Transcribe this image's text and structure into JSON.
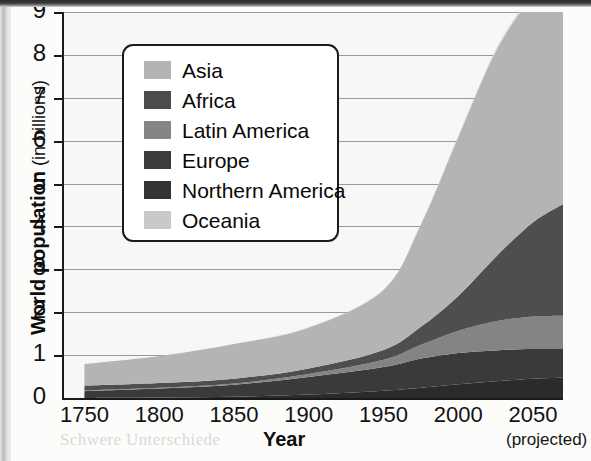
{
  "chart_data": {
    "type": "area",
    "xlabel": "Year",
    "ylabel": "World population (in billions)",
    "ylabel_main": "World population",
    "ylabel_sub": "(in billions)",
    "projected_note": "(projected)",
    "xlim": [
      1735,
      2070
    ],
    "ylim": [
      0,
      9
    ],
    "xticks": [
      1750,
      1800,
      1850,
      1900,
      1950,
      2000,
      2050
    ],
    "xtick_labels": [
      "1750",
      "1800",
      "1850",
      "1900",
      "1950",
      "2000",
      "2050"
    ],
    "yticks": [
      0,
      1,
      2,
      3,
      4,
      5,
      6,
      7,
      8,
      9
    ],
    "ytick_labels": [
      "0",
      "1",
      "2",
      "3",
      "4",
      "5",
      "6",
      "7",
      "8",
      "9"
    ],
    "grid": true,
    "legend_position": "upper-left-inset",
    "stack_order_bottom_to_top": [
      "Northern America",
      "Europe",
      "Latin America",
      "Africa",
      "Asia",
      "Oceania"
    ],
    "x": [
      1750,
      1800,
      1850,
      1900,
      1950,
      1975,
      2000,
      2025,
      2050,
      2070
    ],
    "series": [
      {
        "name": "Asia",
        "color": "#b4b4b4",
        "values": [
          0.5,
          0.63,
          0.81,
          0.95,
          1.4,
          2.38,
          3.7,
          4.78,
          5.26,
          5.3
        ]
      },
      {
        "name": "Africa",
        "color": "#4e4e4e",
        "values": [
          0.11,
          0.11,
          0.11,
          0.13,
          0.23,
          0.42,
          0.81,
          1.5,
          2.2,
          2.6
        ]
      },
      {
        "name": "Latin America",
        "color": "#848484",
        "values": [
          0.02,
          0.02,
          0.03,
          0.07,
          0.17,
          0.32,
          0.52,
          0.68,
          0.76,
          0.78
        ]
      },
      {
        "name": "Europe",
        "color": "#3a3a3a",
        "values": [
          0.16,
          0.21,
          0.28,
          0.41,
          0.55,
          0.68,
          0.73,
          0.72,
          0.69,
          0.67
        ]
      },
      {
        "name": "Northern America",
        "color": "#2b2b2b",
        "values": [
          0.0,
          0.01,
          0.03,
          0.08,
          0.17,
          0.24,
          0.32,
          0.39,
          0.45,
          0.47
        ]
      },
      {
        "name": "Oceania",
        "color": "#cdcdcd",
        "values": [
          0.0,
          0.0,
          0.0,
          0.01,
          0.01,
          0.02,
          0.03,
          0.04,
          0.05,
          0.06
        ]
      }
    ],
    "total_values": [
      0.79,
      0.98,
      1.26,
      1.65,
      2.53,
      4.06,
      6.11,
      8.11,
      9.41,
      9.88
    ]
  },
  "legend": {
    "items": [
      {
        "label": "Asia",
        "color": "#b4b4b4"
      },
      {
        "label": "Africa",
        "color": "#4c4c4c"
      },
      {
        "label": "Latin America",
        "color": "#858585"
      },
      {
        "label": "Europe",
        "color": "#3b3b3b"
      },
      {
        "label": "Northern America",
        "color": "#343434"
      },
      {
        "label": "Oceania",
        "color": "#c9c9c9"
      }
    ]
  },
  "axes": {
    "y_title_main": "World population",
    "y_title_sub": " (in billions)",
    "x_title": "Year",
    "x_projected": "(projected)",
    "y_labels": [
      "9",
      "8",
      "7",
      "6",
      "5",
      "4",
      "3",
      "2",
      "1",
      "0"
    ],
    "x_labels": [
      "1750",
      "1800",
      "1850",
      "1900",
      "1950",
      "2000",
      "2050"
    ]
  },
  "artifacts": {
    "bleed_lines": [
      "ten die population des min-",
      "tehn",
      "ber",
      "sen",
      "Die ent-",
      "bis die Welt",
      "population entlang von Be-",
      "dingungen in diesem Jahr.",
      "Schwere Unterschiede"
    ]
  }
}
